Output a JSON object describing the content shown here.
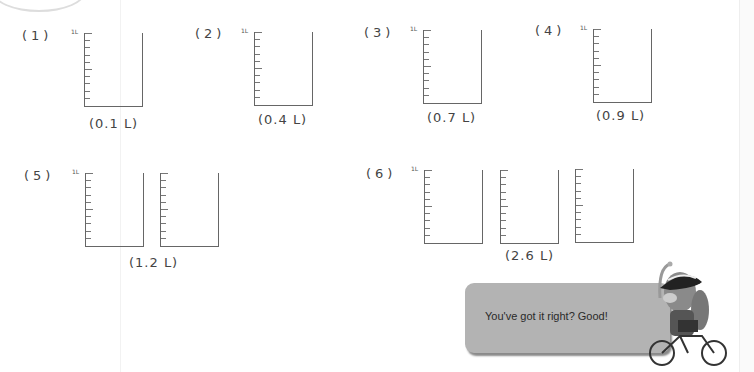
{
  "problems": [
    {
      "label": "(1)",
      "answer": "(0.1 L)",
      "containers": 1
    },
    {
      "label": "(2)",
      "answer": "(0.4 L)",
      "containers": 1
    },
    {
      "label": "(3)",
      "answer": "(0.7 L)",
      "containers": 1
    },
    {
      "label": "(4)",
      "answer": "(0.9 L)",
      "containers": 1
    },
    {
      "label": "(5)",
      "answer": "(1.2 L)",
      "containers": 2
    },
    {
      "label": "(6)",
      "answer": "(2.6 L)",
      "containers": 3
    }
  ],
  "scale_label": "1L",
  "bubble": {
    "text": "You've got it right? Good!",
    "color": "#b3b3b3"
  },
  "mascot": "dog-on-bicycle-with-helmet"
}
